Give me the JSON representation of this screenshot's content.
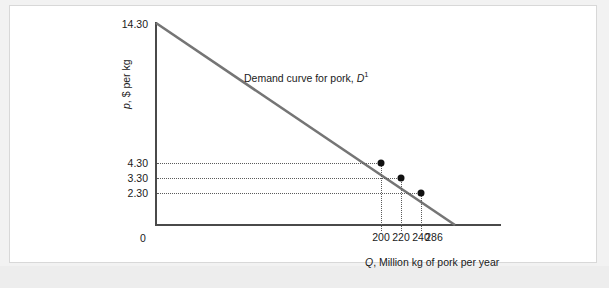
{
  "chart_data": {
    "type": "line",
    "title": "",
    "xlabel": "Q, Million kg of pork per year",
    "ylabel": "p, $ per kg",
    "curve_label": "Demand curve for pork, ",
    "curve_label_symbol": "D",
    "curve_label_superscript": "1",
    "xlim": [
      0,
      330
    ],
    "ylim": [
      0,
      14.3
    ],
    "grid": false,
    "legend": "none",
    "y_ticks": [
      "14.30",
      "4.30",
      "3.30",
      "2.30"
    ],
    "x_ticks": [
      "200",
      "220",
      "240",
      "286"
    ],
    "origin_label": "0",
    "series": [
      {
        "name": "Demand curve for pork, D1",
        "x": [
          0,
          286
        ],
        "y": [
          14.3,
          0
        ],
        "color": "#757575"
      }
    ],
    "points": [
      {
        "x": 200,
        "y": 4.3,
        "label": ""
      },
      {
        "x": 220,
        "y": 3.3,
        "label": ""
      },
      {
        "x": 240,
        "y": 2.3,
        "label": ""
      }
    ]
  }
}
